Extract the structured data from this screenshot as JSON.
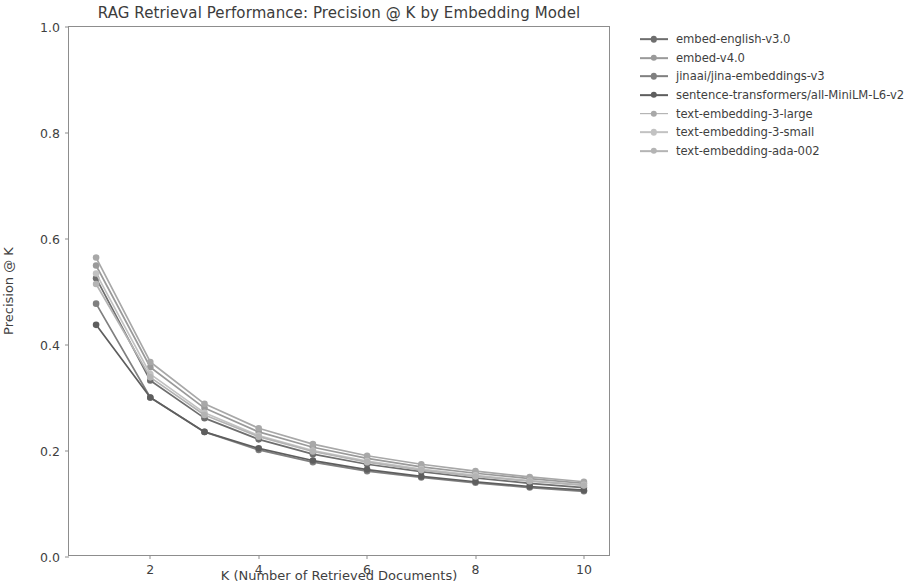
{
  "chart_data": {
    "type": "line",
    "title": "RAG Retrieval Performance: Precision @ K by Embedding Model",
    "xlabel": "K (Number of Retrieved Documents)",
    "ylabel": "Precision @ K",
    "xlim": [
      0.5,
      10.5
    ],
    "ylim": [
      0.0,
      1.0
    ],
    "xticks": [
      2,
      4,
      6,
      8,
      10
    ],
    "xtick_labels": [
      "2",
      "4",
      "6",
      "8",
      "10"
    ],
    "yticks": [
      0.0,
      0.2,
      0.4,
      0.6,
      0.8,
      1.0
    ],
    "ytick_labels": [
      "0.0",
      "0.2",
      "0.4",
      "0.6",
      "0.8",
      "1.0"
    ],
    "grid": false,
    "legend_position": "outside right, upper",
    "marker": "circle",
    "x": [
      1,
      2,
      3,
      4,
      5,
      6,
      7,
      8,
      9,
      10
    ],
    "series": [
      {
        "name": "embed-english-v3.0",
        "color": "#6e6e6e",
        "values": [
          0.526,
          0.333,
          0.262,
          0.222,
          0.194,
          0.175,
          0.161,
          0.149,
          0.139,
          0.131
        ]
      },
      {
        "name": "embed-v4.0",
        "color": "#9a9a9a",
        "values": [
          0.55,
          0.358,
          0.281,
          0.236,
          0.207,
          0.186,
          0.17,
          0.158,
          0.148,
          0.139
        ]
      },
      {
        "name": "jinaai/jina-embeddings-v3",
        "color": "#808080",
        "values": [
          0.478,
          0.301,
          0.236,
          0.202,
          0.179,
          0.162,
          0.15,
          0.14,
          0.131,
          0.124
        ]
      },
      {
        "name": "sentence-transformers/all-MiniLM-L6-v2",
        "color": "#5e5e5e",
        "values": [
          0.438,
          0.301,
          0.236,
          0.205,
          0.182,
          0.165,
          0.152,
          0.142,
          0.133,
          0.126
        ]
      },
      {
        "name": "text-embedding-3-large",
        "color": "#a8a8a8",
        "values": [
          0.565,
          0.368,
          0.289,
          0.243,
          0.213,
          0.191,
          0.175,
          0.162,
          0.151,
          0.142
        ]
      },
      {
        "name": "text-embedding-3-small",
        "color": "#c2c2c2",
        "values": [
          0.535,
          0.345,
          0.272,
          0.229,
          0.201,
          0.181,
          0.166,
          0.154,
          0.144,
          0.136
        ]
      },
      {
        "name": "text-embedding-ada-002",
        "color": "#b4b4b4",
        "values": [
          0.515,
          0.339,
          0.268,
          0.227,
          0.199,
          0.179,
          0.164,
          0.152,
          0.143,
          0.135
        ]
      }
    ]
  }
}
